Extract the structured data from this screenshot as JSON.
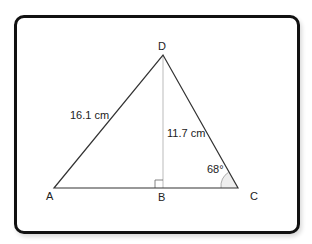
{
  "diagram": {
    "vertices": {
      "A": "A",
      "B": "B",
      "C": "C",
      "D": "D"
    },
    "labels": {
      "side_ad": "16.1 cm",
      "height_db": "11.7 cm",
      "angle_c": "68°"
    },
    "colors": {
      "line": "#333333",
      "height_line": "#bbbbbb",
      "arc_fill": "#eeeeee",
      "frame": "#111111"
    }
  }
}
